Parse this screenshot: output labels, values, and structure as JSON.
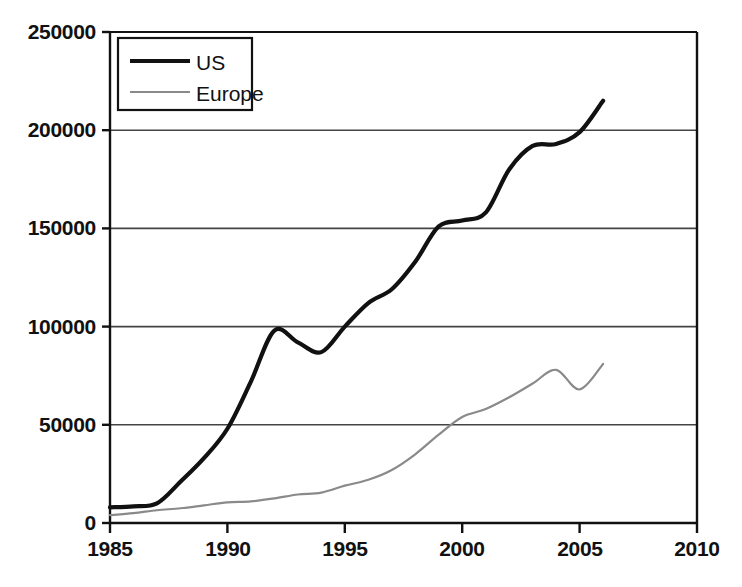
{
  "chart_data": {
    "type": "line",
    "title": "",
    "xlabel": "",
    "ylabel": "",
    "xlim": [
      1985,
      2010
    ],
    "ylim": [
      0,
      250000
    ],
    "grid": "horizontal",
    "legend_position": "top-left",
    "x_ticks": [
      "1985",
      "1990",
      "1995",
      "2000",
      "2005",
      "2010"
    ],
    "x_tick_values": [
      1985,
      1990,
      1995,
      2000,
      2005,
      2010
    ],
    "y_ticks": [
      "0",
      "50000",
      "100000",
      "150000",
      "200000",
      "250000"
    ],
    "y_tick_values": [
      0,
      50000,
      100000,
      150000,
      200000,
      250000
    ],
    "series": [
      {
        "name": "US",
        "color": "#111111",
        "width": 4.2,
        "x": [
          1985,
          1986,
          1987,
          1988,
          1989,
          1990,
          1991,
          1992,
          1993,
          1994,
          1995,
          1996,
          1997,
          1998,
          1999,
          2000,
          2001,
          2002,
          2003,
          2004,
          2005,
          2006
        ],
        "values": [
          8000,
          8500,
          10000,
          21000,
          33000,
          48000,
          72000,
          98000,
          92000,
          87000,
          100000,
          112000,
          119000,
          133000,
          151000,
          154000,
          158000,
          180000,
          192000,
          193000,
          199000,
          215000
        ]
      },
      {
        "name": "Europe",
        "color": "#8a8a8a",
        "width": 2.2,
        "x": [
          1985,
          1986,
          1987,
          1988,
          1989,
          1990,
          1991,
          1992,
          1993,
          1994,
          1995,
          1996,
          1997,
          1998,
          1999,
          2000,
          2001,
          2002,
          2003,
          2004,
          2005,
          2006
        ],
        "values": [
          4000,
          5000,
          6500,
          7500,
          9000,
          10500,
          11000,
          12500,
          14500,
          15500,
          19000,
          22000,
          27000,
          35000,
          45000,
          54000,
          58000,
          64000,
          71000,
          78000,
          68000,
          81000
        ]
      }
    ]
  },
  "legend": {
    "items": [
      {
        "label": "US",
        "swatch": "us-line-swatch"
      },
      {
        "label": "Europe",
        "swatch": "europe-line-swatch"
      }
    ]
  },
  "axes": {
    "y_labels": [
      "250000",
      "200000",
      "150000",
      "100000",
      "50000",
      "0"
    ],
    "x_labels": [
      "1985",
      "1990",
      "1995",
      "2000",
      "2005",
      "2010"
    ]
  },
  "colors": {
    "us": "#111111",
    "europe": "#8a8a8a",
    "axis": "#111111",
    "grid": "#444444",
    "background": "#ffffff"
  }
}
